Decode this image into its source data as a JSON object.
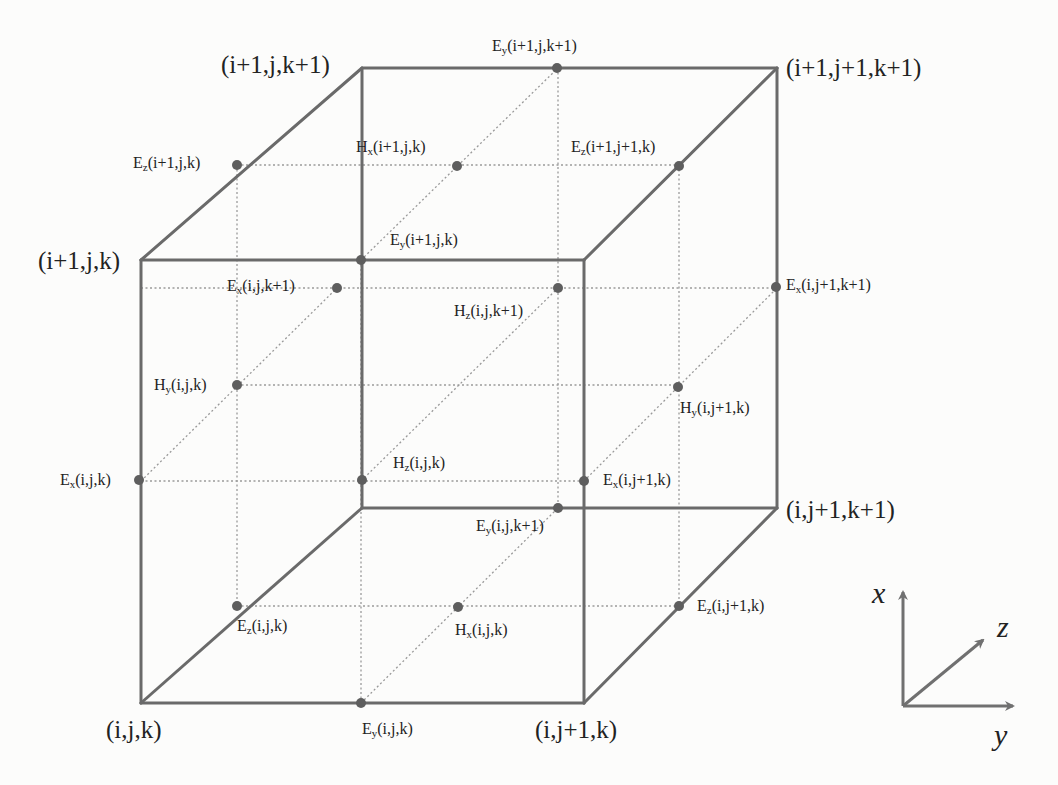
{
  "diagram": {
    "colors": {
      "edge": "#6a6a6a",
      "dotted": "#9a9a9a",
      "node": "#5e5e5e",
      "text": "#222222",
      "background": "#fcfcfb"
    },
    "corners": [
      {
        "id": "c-i1-j-k1",
        "label": "(i+1,j,k+1)",
        "x": 362,
        "y": 68
      },
      {
        "id": "c-i1-j1-k1",
        "label": "(i+1,j+1,k+1)",
        "x": 777,
        "y": 68
      },
      {
        "id": "c-i1-j-k",
        "label": "(i+1,j,k)",
        "x": 141,
        "y": 260
      },
      {
        "id": "c-i-j1-k1",
        "label": "(i,j+1,k+1)",
        "x": 777,
        "y": 508
      },
      {
        "id": "c-i-j-k",
        "label": "(i,j,k)",
        "x": 141,
        "y": 703
      },
      {
        "id": "c-i-j1-k",
        "label": "(i,j+1,k)",
        "x": 584,
        "y": 703
      }
    ],
    "fields": [
      {
        "comp": "E",
        "sub": "y",
        "idx": "(i+1,j,k+1)",
        "x": 557,
        "y": 68
      },
      {
        "comp": "E",
        "sub": "z",
        "idx": "(i+1,j,k)",
        "x": 237,
        "y": 165
      },
      {
        "comp": "H",
        "sub": "x",
        "idx": "(i+1,j,k)",
        "x": 457,
        "y": 166
      },
      {
        "comp": "E",
        "sub": "z",
        "idx": "(i+1,j+1,k)",
        "x": 679,
        "y": 166
      },
      {
        "comp": "E",
        "sub": "y",
        "idx": "(i+1,j,k)",
        "x": 361,
        "y": 260
      },
      {
        "comp": "E",
        "sub": "x",
        "idx": "(i,j,k+1)",
        "x": 337,
        "y": 288
      },
      {
        "comp": "H",
        "sub": "z",
        "idx": "(i,j,k+1)",
        "x": 558,
        "y": 288
      },
      {
        "comp": "E",
        "sub": "x",
        "idx": "(i,j+1,k+1)",
        "x": 776,
        "y": 287
      },
      {
        "comp": "H",
        "sub": "y",
        "idx": "(i,j,k)",
        "x": 237,
        "y": 385
      },
      {
        "comp": "H",
        "sub": "y",
        "idx": "(i,j+1,k)",
        "x": 678,
        "y": 387
      },
      {
        "comp": "E",
        "sub": "x",
        "idx": "(i,j,k)",
        "x": 139,
        "y": 480
      },
      {
        "comp": "H",
        "sub": "z",
        "idx": "(i,j,k)",
        "x": 362,
        "y": 480
      },
      {
        "comp": "E",
        "sub": "x",
        "idx": "(i,j+1,k)",
        "x": 584,
        "y": 481
      },
      {
        "comp": "E",
        "sub": "y",
        "idx": "(i,j,k+1)",
        "x": 558,
        "y": 508
      },
      {
        "comp": "E",
        "sub": "z",
        "idx": "(i,j,k)",
        "x": 237,
        "y": 606
      },
      {
        "comp": "H",
        "sub": "x",
        "idx": "(i,j,k)",
        "x": 458,
        "y": 607
      },
      {
        "comp": "E",
        "sub": "z",
        "idx": "(i,j+1,k)",
        "x": 679,
        "y": 606
      },
      {
        "comp": "E",
        "sub": "y",
        "idx": "(i,j,k)",
        "x": 361,
        "y": 703
      }
    ],
    "axes": {
      "x": "x",
      "y": "y",
      "z": "z"
    }
  }
}
